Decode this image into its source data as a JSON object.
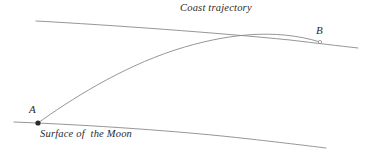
{
  "figure": {
    "width": 372,
    "height": 156,
    "background_color": "#ffffff",
    "line_color": "#8a8a8a",
    "text_color": "#2b2b2b"
  },
  "labels": {
    "coast_trajectory": "Coast trajectory",
    "surface_of_the_moon": "Surface of  the Moon",
    "point_a": "A",
    "point_b": "B"
  },
  "chart_data": {
    "type": "line",
    "title": "",
    "xlabel": "",
    "ylabel": "",
    "xlim": [
      0,
      372
    ],
    "ylim": [
      156,
      0
    ],
    "grid": false,
    "legend": "none",
    "annotations": [
      {
        "name": "coast-trajectory-label",
        "text": "Coast trajectory",
        "x": 180,
        "y": 12
      },
      {
        "name": "surface-label",
        "text": "Surface of  the Moon",
        "x": 40,
        "y": 138
      },
      {
        "name": "point-a-label",
        "text": "A",
        "x": 31,
        "y": 113
      },
      {
        "name": "point-b-label",
        "text": "B",
        "x": 318,
        "y": 34
      }
    ],
    "points": [
      {
        "name": "A",
        "x": 38,
        "y": 123,
        "marker": "filled-circle",
        "size": 2.6
      },
      {
        "name": "B",
        "x": 320,
        "y": 42,
        "marker": "open-circle",
        "size": 1.6
      }
    ],
    "series": [
      {
        "name": "coast-trajectory",
        "description": "Gently descending arc across the top of the figure, passing through point B",
        "path": "M 36 21 C 110 25, 220 33, 290 40 C 315 43, 340 46, 358 48",
        "x": [
          36,
          110,
          180,
          250,
          290,
          320,
          358
        ],
        "y": [
          21,
          25,
          30,
          36,
          40,
          43,
          48
        ]
      },
      {
        "name": "ascent-trajectory",
        "description": "Powered ascent curve rising from point A on the surface, flattening and meeting the coast trajectory near point B",
        "path": "M 38 123 C 70 100, 120 68, 175 50 C 225 34, 275 28, 320 42",
        "x": [
          38,
          70,
          110,
          150,
          200,
          250,
          290,
          320
        ],
        "y": [
          123,
          101,
          80,
          63,
          45,
          36,
          36,
          42
        ]
      },
      {
        "name": "moon-surface",
        "description": "Shallow convex curve of the lunar surface passing through point A and descending to the right",
        "path": "M 14 122 C 90 125, 180 131, 250 139 C 285 143, 310 146, 326 148",
        "x": [
          14,
          90,
          180,
          250,
          290,
          326
        ],
        "y": [
          122,
          125,
          131,
          139,
          144,
          148
        ]
      }
    ]
  }
}
